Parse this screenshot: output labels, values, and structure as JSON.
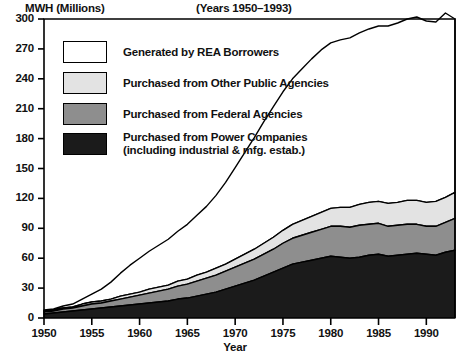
{
  "chart_data": {
    "type": "area",
    "title": "(Years 1950–1993)",
    "xlabel": "Year",
    "ylabel": "MWH (Millions)",
    "stacked": true,
    "grid": false,
    "legend_position": "upper-left-inside",
    "xlim": [
      1950,
      1993
    ],
    "ylim": [
      0,
      300
    ],
    "yticks": [
      0,
      30,
      60,
      90,
      120,
      150,
      180,
      210,
      240,
      270,
      300
    ],
    "xticks": [
      1950,
      1955,
      1960,
      1965,
      1970,
      1975,
      1980,
      1985,
      1990
    ],
    "x": [
      1950,
      1951,
      1952,
      1953,
      1954,
      1955,
      1956,
      1957,
      1958,
      1959,
      1960,
      1961,
      1962,
      1963,
      1964,
      1965,
      1966,
      1967,
      1968,
      1969,
      1970,
      1971,
      1972,
      1973,
      1974,
      1975,
      1976,
      1977,
      1978,
      1979,
      1980,
      1981,
      1982,
      1983,
      1984,
      1985,
      1986,
      1987,
      1988,
      1989,
      1990,
      1991,
      1992,
      1993
    ],
    "series": [
      {
        "name": "Purchased from Power Companies (including industrial & mfg. estab.)",
        "key": "power_companies",
        "color": "#1b1b1b",
        "values": [
          4,
          5,
          6,
          7,
          8,
          9,
          10,
          11,
          12,
          13,
          14,
          15,
          16,
          17,
          19,
          20,
          22,
          24,
          26,
          29,
          32,
          35,
          38,
          42,
          46,
          50,
          54,
          56,
          58,
          60,
          62,
          61,
          60,
          61,
          63,
          64,
          62,
          63,
          64,
          65,
          64,
          63,
          66,
          68
        ]
      },
      {
        "name": "Purchased from Federal Agencies",
        "key": "federal_agencies",
        "color": "#8e8e8e",
        "values": [
          2,
          2,
          3,
          3,
          4,
          5,
          5,
          6,
          7,
          8,
          9,
          10,
          11,
          12,
          13,
          14,
          15,
          16,
          17,
          18,
          19,
          20,
          21,
          22,
          23,
          25,
          26,
          27,
          28,
          29,
          30,
          31,
          31,
          32,
          31,
          31,
          30,
          30,
          30,
          29,
          28,
          29,
          30,
          32
        ]
      },
      {
        "name": "Purchased from Other Public Agencies",
        "key": "other_public_agencies",
        "color": "#e3e3e3",
        "values": [
          1,
          1,
          1,
          1,
          2,
          2,
          2,
          2,
          3,
          3,
          3,
          4,
          4,
          4,
          5,
          5,
          6,
          6,
          7,
          7,
          8,
          9,
          10,
          11,
          12,
          13,
          14,
          15,
          16,
          17,
          18,
          19,
          20,
          21,
          22,
          22,
          23,
          23,
          24,
          24,
          24,
          25,
          25,
          26
        ]
      },
      {
        "name": "Generated by REA Borrowers",
        "key": "rea_generated",
        "color": "#ffffff",
        "values": [
          1,
          1,
          2,
          3,
          5,
          8,
          12,
          17,
          23,
          29,
          34,
          38,
          42,
          46,
          50,
          55,
          60,
          66,
          73,
          82,
          92,
          102,
          112,
          122,
          131,
          139,
          146,
          152,
          158,
          163,
          166,
          168,
          170,
          172,
          174,
          176,
          178,
          180,
          182,
          184,
          182,
          180,
          185,
          174
        ]
      }
    ],
    "totals": [
      8,
      9,
      12,
      14,
      19,
      24,
      29,
      36,
      45,
      53,
      60,
      67,
      73,
      79,
      87,
      94,
      103,
      112,
      123,
      136,
      151,
      166,
      181,
      197,
      212,
      227,
      240,
      250,
      260,
      269,
      276,
      279,
      281,
      286,
      290,
      293,
      293,
      296,
      300,
      302,
      298,
      297,
      306,
      300
    ]
  },
  "legend": {
    "items": [
      {
        "label": "Generated by REA Borrowers",
        "swatch": "white"
      },
      {
        "label": "Purchased from Other Public Agencies",
        "swatch": "light"
      },
      {
        "label": "Purchased from Federal Agencies",
        "swatch": "mid"
      },
      {
        "label_line1": "Purchased from Power Companies",
        "label_line2": "(including industrial & mfg. estab.)",
        "swatch": "dark"
      }
    ]
  }
}
